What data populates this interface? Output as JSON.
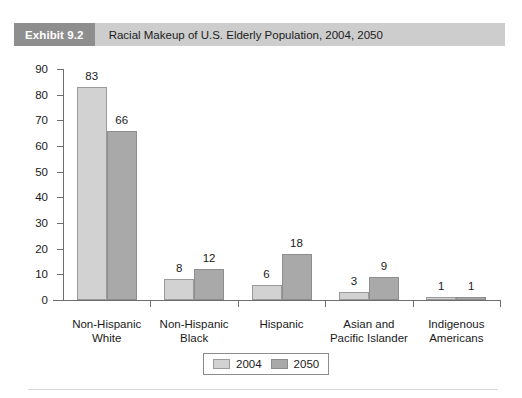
{
  "exhibit": {
    "tag": "Exhibit 9.2",
    "title": "Racial Makeup of U.S. Elderly Population, 2004, 2050"
  },
  "colors": {
    "series_2004": "#d2d2d2",
    "series_2050": "#a9a9a9",
    "tag_background": "#8e8e8e",
    "header_background": "#cdcdcd",
    "axis": "#6e6e6e"
  },
  "legend": {
    "position": "bottom-center",
    "entries": [
      {
        "label": "2004",
        "color": "#d2d2d2"
      },
      {
        "label": "2050",
        "color": "#a9a9a9"
      }
    ]
  },
  "chart_data": {
    "type": "bar",
    "title": "Racial Makeup of U.S. Elderly Population, 2004, 2050",
    "xlabel": "",
    "ylabel": "",
    "ylim": [
      0,
      90
    ],
    "yticks": [
      0,
      10,
      20,
      30,
      40,
      50,
      60,
      70,
      80,
      90
    ],
    "grid": false,
    "categories": [
      "Non-Hispanic White",
      "Non-Hispanic Black",
      "Hispanic",
      "Asian and Pacific Islander",
      "Indigenous Americans"
    ],
    "category_lines": [
      [
        "Non-Hispanic",
        "White"
      ],
      [
        "Non-Hispanic",
        "Black"
      ],
      [
        "Hispanic",
        ""
      ],
      [
        "Asian and",
        "Pacific Islander"
      ],
      [
        "Indigenous",
        "Americans"
      ]
    ],
    "series": [
      {
        "name": "2004",
        "color": "#d2d2d2",
        "values": [
          83,
          8,
          6,
          3,
          1
        ]
      },
      {
        "name": "2050",
        "color": "#a9a9a9",
        "values": [
          66,
          12,
          18,
          9,
          1
        ]
      }
    ]
  }
}
